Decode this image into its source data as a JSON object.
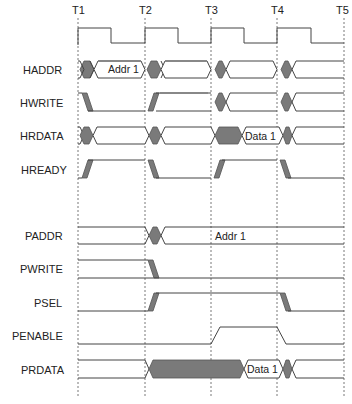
{
  "diagram": {
    "time_markers": [
      {
        "label": "T1",
        "x": 78
      },
      {
        "label": "T2",
        "x": 145
      },
      {
        "label": "T3",
        "x": 211
      },
      {
        "label": "T4",
        "x": 277
      },
      {
        "label": "T5",
        "x": 344
      }
    ],
    "signals": [
      {
        "name": "HCLK",
        "label": ""
      },
      {
        "name": "HADDR",
        "label": "HADDR",
        "value": "Addr 1"
      },
      {
        "name": "HWRITE",
        "label": "HWRITE"
      },
      {
        "name": "HRDATA",
        "label": "HRDATA",
        "value": "Data 1"
      },
      {
        "name": "HREADY",
        "label": "HREADY"
      },
      {
        "name": "PADDR",
        "label": "PADDR",
        "value": "Addr 1"
      },
      {
        "name": "PWRITE",
        "label": "PWRITE"
      },
      {
        "name": "PSEL",
        "label": "PSEL"
      },
      {
        "name": "PENABLE",
        "label": "PENABLE"
      },
      {
        "name": "PRDATA",
        "label": "PRDATA",
        "value": "Data 1"
      }
    ],
    "colors": {
      "line": "#444444",
      "fill": "#7a7a7a",
      "grid": "#555555",
      "background": "#ffffff"
    }
  }
}
